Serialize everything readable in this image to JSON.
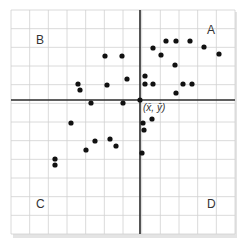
{
  "chart_data": {
    "type": "scatter",
    "title": "",
    "xlabel": "",
    "ylabel": "",
    "grid": true,
    "grid_cells": {
      "columns": 12,
      "rows": 12
    },
    "mean_point_label": "(x̄, ȳ)",
    "quadrant_labels": {
      "A": "A",
      "B": "B",
      "C": "C",
      "D": "D"
    },
    "axes_origin": "mean point (x̄, ȳ)",
    "points_grid_units": [
      {
        "x": 3.6,
        "y": 0.9
      },
      {
        "x": 3.7,
        "y": 0.6
      },
      {
        "x": 5.0,
        "y": 2.3
      },
      {
        "x": 5.9,
        "y": 2.3
      },
      {
        "x": 5.1,
        "y": 0.8
      },
      {
        "x": 4.3,
        "y": -0.2
      },
      {
        "x": 6.2,
        "y": 1.1
      },
      {
        "x": 5.9,
        "y": -0.2
      },
      {
        "x": 7.2,
        "y": 1.3
      },
      {
        "x": 7.2,
        "y": 0.8
      },
      {
        "x": 7.6,
        "y": 0.8
      },
      {
        "x": 7.6,
        "y": 2.8
      },
      {
        "x": 8.0,
        "y": 2.4
      },
      {
        "x": 8.3,
        "y": 3.2
      },
      {
        "x": 8.8,
        "y": 3.2
      },
      {
        "x": 9.6,
        "y": 3.2
      },
      {
        "x": 8.7,
        "y": 1.9
      },
      {
        "x": 9.2,
        "y": 0.8
      },
      {
        "x": 9.7,
        "y": 0.8
      },
      {
        "x": 8.8,
        "y": 0.3
      },
      {
        "x": 10.3,
        "y": 2.9
      },
      {
        "x": 11.1,
        "y": 2.5
      },
      {
        "x": 7.1,
        "y": 0.0
      },
      {
        "x": 7.3,
        "y": -1.2
      },
      {
        "x": 7.7,
        "y": -1.0
      },
      {
        "x": 7.3,
        "y": -1.6
      },
      {
        "x": 7.1,
        "y": -2.8
      },
      {
        "x": 3.2,
        "y": -1.2
      },
      {
        "x": 2.3,
        "y": -3.1
      },
      {
        "x": 2.3,
        "y": -3.5
      },
      {
        "x": 4.0,
        "y": -2.7
      },
      {
        "x": 4.5,
        "y": -2.2
      },
      {
        "x": 5.3,
        "y": -2.0
      },
      {
        "x": 5.6,
        "y": -2.5
      }
    ],
    "points_px": [
      [
        78,
        84
      ],
      [
        80,
        90
      ],
      [
        105,
        56
      ],
      [
        122,
        56
      ],
      [
        107,
        85
      ],
      [
        91,
        103
      ],
      [
        127,
        79
      ],
      [
        123,
        103
      ],
      [
        145,
        76
      ],
      [
        145,
        84
      ],
      [
        153,
        84
      ],
      [
        153,
        48
      ],
      [
        161,
        55
      ],
      [
        166,
        41
      ],
      [
        176,
        41
      ],
      [
        190,
        41
      ],
      [
        175,
        65
      ],
      [
        183,
        84
      ],
      [
        192,
        84
      ],
      [
        176,
        93
      ],
      [
        204,
        47
      ],
      [
        219,
        54
      ],
      [
        140,
        100
      ],
      [
        143,
        123
      ],
      [
        152,
        119
      ],
      [
        144,
        130
      ],
      [
        142,
        153
      ],
      [
        71,
        123
      ],
      [
        55,
        159
      ],
      [
        55,
        165
      ],
      [
        86,
        150
      ],
      [
        95,
        141
      ],
      [
        110,
        139
      ],
      [
        116,
        146
      ]
    ],
    "layout": {
      "grid_left": 11,
      "grid_top": 10,
      "grid_right": 235,
      "grid_bottom": 234,
      "axis_x_px": 140,
      "axis_y_px": 100,
      "label_positions": {
        "A": [
          207,
          34
        ],
        "B": [
          36,
          44
        ],
        "C": [
          36,
          208
        ],
        "D": [
          207,
          208
        ],
        "mean": [
          143,
          111
        ]
      }
    },
    "colors": {
      "grid": "#d0d0d0",
      "axis": "#2a2a2a",
      "point": "#111111",
      "label": "#333333"
    }
  }
}
